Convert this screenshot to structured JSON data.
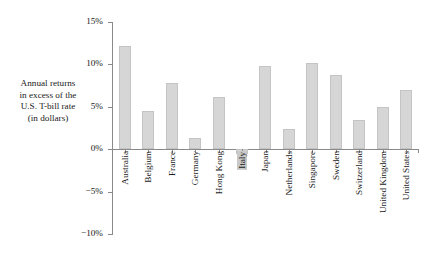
{
  "axis_caption": {
    "lines": [
      "Annual returns",
      "in excess of the",
      "U.S. T-bill rate",
      "(in dollars)"
    ]
  },
  "colors": {
    "bar_fill": "#d6d6d6",
    "bar_border": "#c4c4c4",
    "axis": "#8a8a8a",
    "text": "#1a1a1a",
    "highlight": "#c9c9c9"
  },
  "chart_data": {
    "type": "bar",
    "title": "",
    "xlabel": "",
    "ylabel": "Annual returns in excess of the U.S. T-bill rate (in dollars)",
    "ylim": [
      -10,
      15
    ],
    "ytick_labels": [
      "15%",
      "10%",
      "5%",
      "0%",
      "−5%",
      "−10%"
    ],
    "ytick_values": [
      15,
      10,
      5,
      0,
      -5,
      -10
    ],
    "grid": false,
    "legend": "none",
    "highlighted_category": "Italy",
    "categories": [
      "Australia",
      "Belgium",
      "France",
      "Germany",
      "Hong Kong",
      "Italy",
      "Japan",
      "Netherlands",
      "Singapore",
      "Sweden",
      "Switzerland",
      "United Kingdom",
      "United States"
    ],
    "values": [
      12.2,
      4.5,
      7.8,
      1.3,
      6.2,
      -0.6,
      9.8,
      2.4,
      10.2,
      8.8,
      3.5,
      5.0,
      7.0
    ]
  }
}
